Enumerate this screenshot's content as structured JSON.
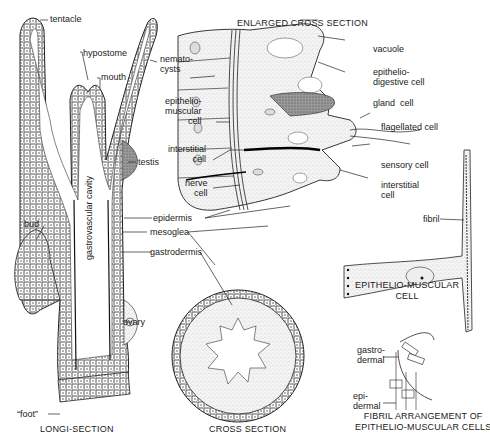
{
  "figure": {
    "panels": {
      "longi_section": {
        "caption": "LONGI-SECTION",
        "labels": {
          "tentacle": "tentacle",
          "hypostome": "hypostome",
          "mouth": "mouth",
          "gastrovascular_cavity": "gastrovascular cavity",
          "testis": "testis",
          "bud": "bud",
          "ovary": "ovary",
          "foot": "“foot”",
          "nematocysts": "nemato-\ncysts"
        }
      },
      "shared_labels": {
        "epidermis": "epidermis",
        "mesoglea": "mesoglea",
        "gastrodermis": "gastrodermis"
      },
      "enlarged_cross_section": {
        "caption": "ENLARGED CROSS SECTION",
        "labels": {
          "vacuole": "vacuole",
          "epithelio_digestive_cell": "epithelio-\ndigestive cell",
          "gland_cell": "gland  cell",
          "flagellated_cell": "flagellated cell",
          "sensory_cell": "sensory cell",
          "interstitial_cell_right": "interstitial\ncell",
          "epithelio_muscular_cell": "epithelio-\nmuscular\ncell",
          "interstitial_cell_left": "interstitial\ncell",
          "nerve_cell": "nerve\ncell"
        }
      },
      "cross_section": {
        "caption": "CROSS SECTION"
      },
      "epithelio_muscular_cell": {
        "caption": "EPITHELIO-MUSCULAR\nCELL",
        "labels": {
          "fibril": "fibril"
        }
      },
      "fibril_arrangement": {
        "caption": "FIBRIL ARRANGEMENT OF\nEPITHELIO-MUSCULAR CELLS",
        "labels": {
          "gastrodermal": "gastro-\ndermal",
          "epidermal": "epi-\ndermal"
        }
      }
    }
  }
}
